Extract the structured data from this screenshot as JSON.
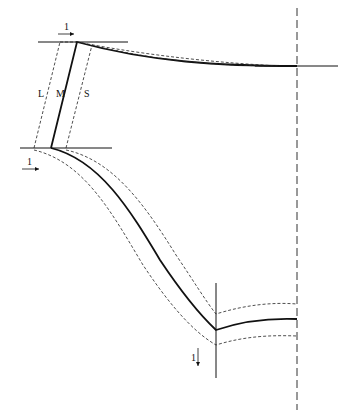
{
  "diagram": {
    "labels": {
      "left_band": "L",
      "middle_line": "M",
      "right_band": "S",
      "top_scale": "1",
      "left_scale": "1",
      "bottom_scale": "1"
    },
    "colors": {
      "line": "#111111",
      "background": "#ffffff"
    }
  }
}
